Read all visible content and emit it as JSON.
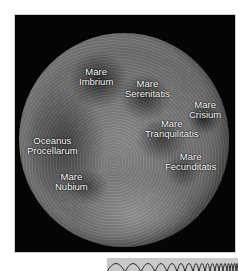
{
  "image": {
    "subject": "Near side of the Moon with labeled maria",
    "labels": [
      {
        "id": "imbrium",
        "line1": "Mare",
        "line2": "Imbrium"
      },
      {
        "id": "serenitatis",
        "line1": "Mare",
        "line2": "Serenitatis"
      },
      {
        "id": "crisium",
        "line1": "Mare",
        "line2": "Crisium"
      },
      {
        "id": "tranquilitatis",
        "line1": "Mare",
        "line2": "Tranquilitatis"
      },
      {
        "id": "procellarum",
        "line1": "Oceanus",
        "line2": "Procellarum"
      },
      {
        "id": "fecunditatis",
        "line1": "Mare",
        "line2": "Fecunditatis"
      },
      {
        "id": "nubium",
        "line1": "Mare",
        "line2": "Nubium"
      }
    ]
  },
  "colors": {
    "background": "#ffffff",
    "space": "#050505",
    "label_text": "#ffffff",
    "strip": "#c9c9c9"
  }
}
